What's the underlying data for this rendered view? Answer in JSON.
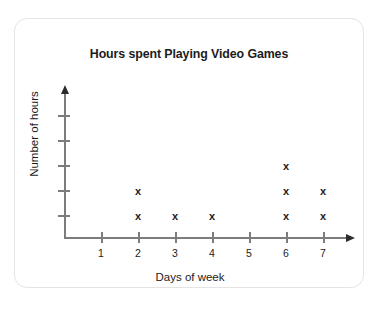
{
  "card": {
    "background": "#ffffff",
    "border_color": "#e4e4e4"
  },
  "chart_data": {
    "type": "scatter",
    "plot_style": "dot-plot-x-marks",
    "title": "Hours spent Playing Video Games",
    "xlabel": "Days of week",
    "ylabel": "Number of hours",
    "categories": [
      "1",
      "2",
      "3",
      "4",
      "5",
      "6",
      "7"
    ],
    "x": [
      1,
      2,
      3,
      4,
      5,
      6,
      7
    ],
    "values": [
      0,
      2,
      1,
      1,
      0,
      3,
      2
    ],
    "counts_by_day": {
      "1": 0,
      "2": 2,
      "3": 1,
      "4": 1,
      "5": 0,
      "6": 3,
      "7": 2
    },
    "marker": "x",
    "marker_color": "#1c1c1c",
    "xlim": [
      0,
      7.8
    ],
    "ylim": [
      0,
      5
    ],
    "y_tick_count": 5,
    "y_tick_labels": [
      "",
      "",
      "",
      "",
      ""
    ],
    "x_tick_labels": [
      "1",
      "2",
      "3",
      "4",
      "5",
      "6",
      "7"
    ],
    "grid": false,
    "legend": null,
    "axis_color": "#7c7c7c",
    "axis_arrows": [
      "up",
      "right"
    ],
    "points": [
      {
        "day": 2,
        "level": 1
      },
      {
        "day": 2,
        "level": 2
      },
      {
        "day": 3,
        "level": 1
      },
      {
        "day": 4,
        "level": 1
      },
      {
        "day": 6,
        "level": 1
      },
      {
        "day": 6,
        "level": 2
      },
      {
        "day": 6,
        "level": 3
      },
      {
        "day": 7,
        "level": 1
      },
      {
        "day": 7,
        "level": 2
      }
    ]
  }
}
